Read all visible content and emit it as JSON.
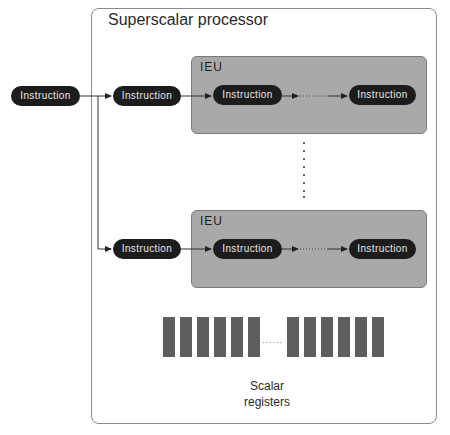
{
  "diagram": {
    "title": "Superscalar processor",
    "input_instruction": "Instruction",
    "ieu_units": [
      {
        "label": "IEU",
        "dispatch_instruction": "Instruction",
        "pipeline_first": "Instruction",
        "pipeline_last": "Instruction"
      },
      {
        "label": "IEU",
        "dispatch_instruction": "Instruction",
        "pipeline_first": "Instruction",
        "pipeline_last": "Instruction"
      }
    ],
    "vertical_ellipsis": "⋮",
    "registers": {
      "label_line1": "Scalar",
      "label_line2": "registers",
      "left_group_count": 6,
      "right_group_count": 6,
      "ellipsis": "......"
    },
    "colors": {
      "pill_bg": "#1c1c1c",
      "pill_text": "#e8e8e8",
      "ieu_bg": "#a9a9a9",
      "register": "#5e5e5e",
      "border": "#8a8a8a"
    }
  }
}
